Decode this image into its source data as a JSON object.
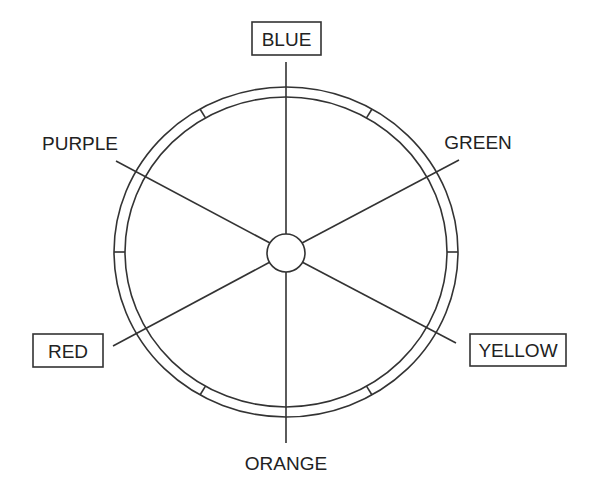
{
  "diagram": {
    "type": "color-wheel",
    "stroke_color": "#333333",
    "labels": {
      "top": "BLUE",
      "top_right": "GREEN",
      "bottom_right": "YELLOW",
      "bottom": "ORANGE",
      "bottom_left": "RED",
      "top_left": "PURPLE"
    },
    "boxed_labels": [
      "BLUE",
      "YELLOW",
      "RED"
    ]
  }
}
